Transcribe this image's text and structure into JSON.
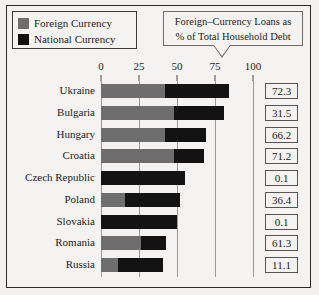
{
  "legend": {
    "items": [
      {
        "label": "Foreign Currency",
        "color": "#6e6e6e",
        "icon": "legend-swatch-foreign"
      },
      {
        "label": "National Currency",
        "color": "#131313",
        "icon": "legend-swatch-national"
      }
    ]
  },
  "callout": {
    "line1": "Foreign–Currency Loans as",
    "line2": "% of Total Household Debt"
  },
  "chart_data": {
    "type": "bar",
    "orientation": "horizontal",
    "stacked": true,
    "title": "",
    "subtitle": "",
    "xlabel": "",
    "ylabel": "",
    "xlim": [
      0,
      100
    ],
    "ticks": [
      0,
      25,
      50,
      75,
      100
    ],
    "tick_labels": [
      "0",
      "25",
      "50",
      "75",
      "100"
    ],
    "grid": true,
    "legend_position": "top-left",
    "categories": [
      "Ukraine",
      "Bulgaria",
      "Hungary",
      "Croatia",
      "Czech Republic",
      "Poland",
      "Slovakia",
      "Romania",
      "Russia"
    ],
    "series": [
      {
        "name": "Foreign Currency",
        "color": "#6e6e6e",
        "values": [
          42,
          48,
          42,
          48,
          0,
          16,
          0,
          26,
          11
        ]
      },
      {
        "name": "National Currency",
        "color": "#131313",
        "values": [
          42,
          33,
          27,
          20,
          55,
          36,
          50,
          17,
          30
        ]
      }
    ],
    "totals": [
      84,
      81,
      69,
      68,
      55,
      52,
      50,
      43,
      41
    ],
    "annotation_label": "Foreign–Currency Loans as % of Total Household Debt",
    "annotations": [
      "72.3",
      "31.5",
      "66.2",
      "71.2",
      "0.1",
      "36.4",
      "0.1",
      "61.3",
      "11.1"
    ]
  }
}
